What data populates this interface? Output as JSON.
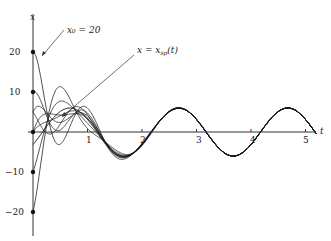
{
  "chart_data": {
    "type": "line",
    "title": "",
    "xlabel": "t",
    "ylabel": "x",
    "xlim": [
      0,
      5.2
    ],
    "ylim": [
      -25,
      27
    ],
    "x_ticks": [
      1,
      2,
      3,
      4,
      5
    ],
    "y_ticks": [
      20,
      10,
      -10,
      -20
    ],
    "grid": false,
    "legend": null,
    "annotations": [
      {
        "text": "x0 = 20",
        "points_to": "curve with x(0)=20"
      },
      {
        "text": "x = xsp(t)",
        "points_to": "steady periodic solution"
      }
    ],
    "steady_state": {
      "amplitude": 6,
      "omega": 3.14159,
      "phase": 0.55
    },
    "transient": {
      "decay": 2.0,
      "mu": 6.0
    },
    "initial_values": [
      20,
      10,
      5,
      0,
      -10,
      -20
    ],
    "initial_slopes": [
      0,
      10,
      30,
      20,
      40,
      60
    ],
    "series_count": 8
  },
  "labels": {
    "y_axis": "x",
    "x_axis": "t",
    "ann1": "x₀ = 20",
    "ann2": "x = x",
    "ann2_sub": "sp",
    "ann2_tail": "(t)"
  },
  "tick_labels": {
    "t1": "1",
    "t2": "2",
    "t3": "3",
    "t4": "4",
    "t5": "5",
    "y20": "20",
    "y10": "10",
    "yn10": "−10",
    "yn20": "−20"
  }
}
